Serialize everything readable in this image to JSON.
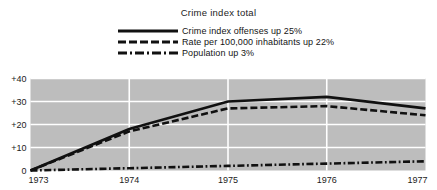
{
  "chart_data": {
    "type": "line",
    "title": "Crime index total",
    "xlabel": "",
    "ylabel": "",
    "x": [
      1973,
      1974,
      1975,
      1976,
      1977
    ],
    "categories": [
      "1973",
      "1974",
      "1975",
      "1976",
      "1977"
    ],
    "xtick_labels": [
      "1973",
      "1974",
      "1975",
      "1976",
      "1977"
    ],
    "ytick_labels": [
      "0",
      "+10",
      "+20",
      "+30",
      "+40"
    ],
    "ytick_values": [
      0,
      10,
      20,
      30,
      40
    ],
    "ylim": [
      0,
      40
    ],
    "xlim": [
      1973,
      1977
    ],
    "grid": true,
    "grid_color": "#ffffff",
    "plot_background": "#bdbdbd",
    "legend_position": "top-center",
    "series": [
      {
        "name": "Crime index offenses up 25%",
        "style": "solid",
        "color": "#111111",
        "values": [
          0,
          18,
          30,
          32,
          27
        ]
      },
      {
        "name": "Rate per 100,000 inhabitants up 22%",
        "style": "dashed",
        "color": "#111111",
        "values": [
          0,
          17,
          27,
          28,
          24
        ]
      },
      {
        "name": "Population up 3%",
        "style": "dash-dot",
        "color": "#111111",
        "values": [
          0,
          1,
          2,
          3,
          4
        ]
      }
    ]
  },
  "legend": {
    "items": [
      {
        "label": "Crime index offenses up 25%",
        "style": "solid"
      },
      {
        "label": "Rate per 100,000 inhabitants up 22%",
        "style": "dashed"
      },
      {
        "label": "Population up 3%",
        "style": "dash-dot"
      }
    ]
  },
  "axes": {
    "y_labels": [
      "+40",
      "+30",
      "+20",
      "+10",
      "0"
    ],
    "x_labels": [
      "1973",
      "1974",
      "1975",
      "1976",
      "1977"
    ]
  }
}
